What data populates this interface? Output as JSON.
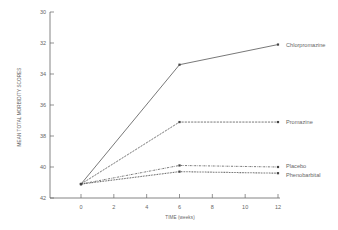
{
  "chart_data": {
    "type": "line",
    "title": "",
    "xlabel": "TIME (weeks)",
    "ylabel": "MEAN TOTAL MORBIDITY SCORES",
    "x": [
      0,
      6,
      12
    ],
    "xticks": [
      0,
      2,
      4,
      6,
      8,
      10,
      12
    ],
    "yticks": [
      30,
      32,
      34,
      36,
      38,
      40,
      42
    ],
    "ylim": [
      42,
      30
    ],
    "y_inverted": true,
    "grid": false,
    "legend_position": "inline-right",
    "series": [
      {
        "name": "Chlorpromazine",
        "values": [
          41.1,
          33.4,
          32.1
        ],
        "style": "solid"
      },
      {
        "name": "Promazine",
        "values": [
          41.1,
          37.1,
          37.1
        ],
        "style": "dashed"
      },
      {
        "name": "Placebo",
        "values": [
          41.1,
          39.9,
          40.0
        ],
        "style": "dash-dot"
      },
      {
        "name": "Phenobarbital",
        "values": [
          41.1,
          40.3,
          40.4
        ],
        "style": "dotted"
      }
    ]
  },
  "colors": {
    "line": "#555555",
    "axis": "#666666"
  }
}
